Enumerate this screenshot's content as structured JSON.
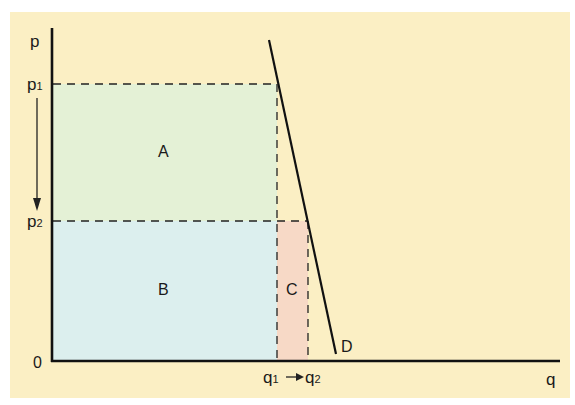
{
  "diagram": {
    "type": "demand-revenue-diagram",
    "axes": {
      "y_label": "p",
      "x_label": "q",
      "origin_label": "0"
    },
    "price_levels": [
      {
        "name": "p",
        "sub": "1"
      },
      {
        "name": "p",
        "sub": "2"
      }
    ],
    "quantity_levels": [
      {
        "name": "q",
        "sub": "1"
      },
      {
        "name": "q",
        "sub": "2"
      }
    ],
    "regions": {
      "A": {
        "label": "A",
        "color": "#e4f1d6"
      },
      "B": {
        "label": "B",
        "color": "#dcefee"
      },
      "C": {
        "label": "C",
        "color": "#f7d9c6"
      }
    },
    "curve_label": "D",
    "colors": {
      "background": "#fbefc4",
      "axis": "#111111"
    }
  }
}
